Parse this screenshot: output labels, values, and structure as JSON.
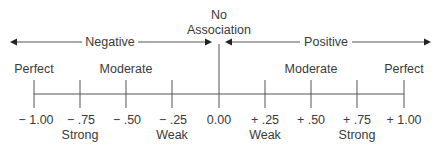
{
  "diagram": {
    "title_top": "No",
    "title_bottom": "Association",
    "negative_label": "Negative",
    "positive_label": "Positive",
    "strength_labels_top": [
      {
        "text": "Perfect",
        "x": 34
      },
      {
        "text": "Moderate",
        "x": 126
      },
      {
        "text": "Moderate",
        "x": 311
      },
      {
        "text": "Perfect",
        "x": 404
      }
    ],
    "ticks": [
      {
        "value": "− 1.00",
        "x": 34,
        "sub": ""
      },
      {
        "value": "− .75",
        "x": 80,
        "sub": "Strong"
      },
      {
        "value": "− .50",
        "x": 126,
        "sub": ""
      },
      {
        "value": "− .25",
        "x": 172,
        "sub": "Weak"
      },
      {
        "value": "0.00",
        "x": 219,
        "sub": ""
      },
      {
        "value": "+ .25",
        "x": 265,
        "sub": "Weak"
      },
      {
        "value": "+ .50",
        "x": 311,
        "sub": ""
      },
      {
        "value": "+ .75",
        "x": 357,
        "sub": "Strong"
      },
      {
        "value": "+ 1.00",
        "x": 404,
        "sub": ""
      }
    ],
    "colors": {
      "line": "#555555",
      "text": "#3a3a3a"
    }
  }
}
